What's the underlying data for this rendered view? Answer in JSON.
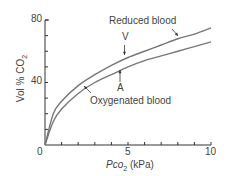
{
  "chart_data": {
    "type": "line",
    "title": "",
    "xlabel": "Pco2 (kPa)",
    "ylabel": "Vol % CO2",
    "xlim": [
      0,
      10
    ],
    "ylim": [
      0,
      80
    ],
    "x_ticks": [
      0,
      5,
      10
    ],
    "y_ticks": [
      0,
      40,
      80
    ],
    "grid": false,
    "series": [
      {
        "name": "Reduced blood",
        "x": [
          0,
          0.5,
          1,
          2,
          3,
          4,
          5,
          6,
          7,
          8,
          9,
          10
        ],
        "values": [
          0,
          20,
          28,
          38,
          45,
          51,
          56,
          60,
          64,
          68,
          71,
          75
        ]
      },
      {
        "name": "Oxygenated blood",
        "x": [
          0,
          0.5,
          1,
          2,
          3,
          4,
          5,
          6,
          7,
          8,
          9,
          10
        ],
        "values": [
          0,
          15,
          23,
          33,
          40,
          45,
          50,
          54,
          57,
          60,
          63,
          66
        ]
      }
    ],
    "annotations": [
      {
        "text": "V",
        "x": 5,
        "y": 56,
        "points_to": "Reduced blood"
      },
      {
        "text": "A",
        "x": 5,
        "y": 50,
        "points_to": "Oxygenated blood"
      },
      {
        "text": "Reduced blood",
        "points_to": "Reduced blood"
      },
      {
        "text": "Oxygenated blood",
        "points_to": "Oxygenated blood"
      }
    ]
  },
  "labels": {
    "y_tick_0": "0",
    "y_tick_40": "40",
    "y_tick_80": "80",
    "x_tick_5": "5",
    "x_tick_10": "10",
    "xlabel_main": "Pco",
    "xlabel_sub": "2",
    "xlabel_unit": " (kPa)",
    "ylabel": "Vol % CO",
    "ylabel_sub": "2",
    "reduced": "Reduced blood",
    "oxygenated": "Oxygenated blood",
    "v": "V",
    "a": "A"
  }
}
